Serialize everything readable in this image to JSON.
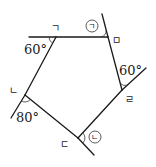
{
  "vertices": {
    "giyeok": "ㄱ",
    "mieum": "ㅁ",
    "rieul": "ㄹ",
    "digeut": "ㄷ",
    "nieun": "ㄴ"
  },
  "angles": {
    "at_giyeok": "60°",
    "at_rieul": "60°",
    "at_nieun": "80°"
  },
  "unknowns": {
    "a": "ㄱ",
    "b": "ㄴ"
  }
}
